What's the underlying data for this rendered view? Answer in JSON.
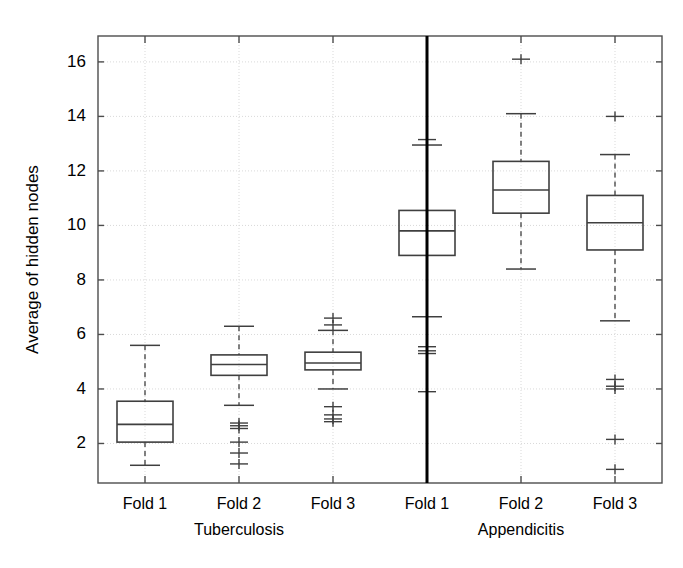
{
  "chart_data": {
    "type": "box",
    "title": "",
    "xlabel": "",
    "ylabel": "Average of hidden nodes",
    "ylim": [
      0.55,
      16.95
    ],
    "yticks": [
      2,
      4,
      6,
      8,
      10,
      12,
      14,
      16
    ],
    "ytick_labels": [
      "2",
      "4",
      "6",
      "8",
      "10",
      "12",
      "14",
      "16"
    ],
    "grid": true,
    "grid_color": "#d9d9d9",
    "axis_color": "#4d4d4d",
    "box_color": "#3f3f3f",
    "median_color": "#3f3f3f",
    "whisker_color": "#3f3f3f",
    "outlier_color": "#3f3f3f",
    "divider_x_value": 3.5,
    "legend": "none",
    "groups": [
      {
        "name": "Tuberculosis",
        "label": "Tuberculosis",
        "folds": [
          {
            "label": "Fold 1",
            "x": 1,
            "whisker_high": 5.6,
            "q3": 3.55,
            "median": 2.7,
            "q1": 2.05,
            "whisker_low": 1.2,
            "outliers": []
          },
          {
            "label": "Fold 2",
            "x": 2,
            "whisker_high": 6.3,
            "q3": 5.25,
            "median": 4.9,
            "q1": 4.5,
            "whisker_low": 3.4,
            "outliers": [
              2.75,
              2.65,
              2.55,
              2.05,
              1.65,
              1.25
            ]
          },
          {
            "label": "Fold 3",
            "x": 3,
            "whisker_high": 6.15,
            "q3": 5.35,
            "median": 4.95,
            "q1": 4.7,
            "whisker_low": 4.0,
            "outliers": [
              6.6,
              6.35,
              3.35,
              3.05,
              2.9,
              2.8
            ]
          }
        ]
      },
      {
        "name": "Appendicitis",
        "label": "Appendicitis",
        "folds": [
          {
            "label": "Fold 1",
            "x": 4,
            "whisker_high": 12.95,
            "q3": 10.55,
            "median": 9.8,
            "q1": 8.9,
            "whisker_low": 6.65,
            "outliers": [
              13.15,
              5.55,
              5.4,
              5.3,
              3.9
            ]
          },
          {
            "label": "Fold 2",
            "x": 5,
            "whisker_high": 14.1,
            "q3": 12.35,
            "median": 11.3,
            "q1": 10.45,
            "whisker_low": 8.4,
            "outliers": [
              16.1
            ]
          },
          {
            "label": "Fold 3",
            "x": 6,
            "whisker_high": 12.6,
            "q3": 11.1,
            "median": 10.1,
            "q1": 9.1,
            "whisker_low": 6.5,
            "outliers": [
              14.0,
              4.35,
              4.1,
              4.0,
              2.15,
              1.05
            ]
          }
        ]
      }
    ]
  }
}
